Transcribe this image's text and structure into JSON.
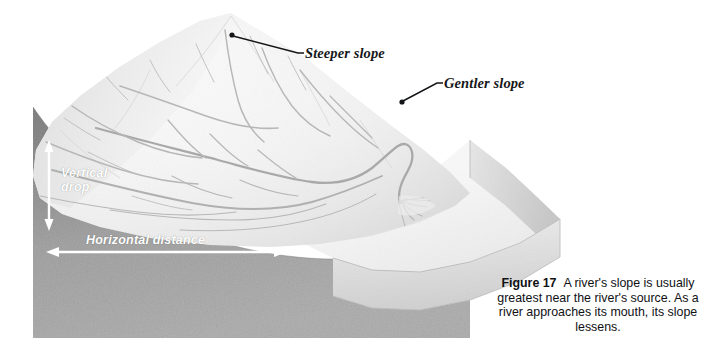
{
  "figure": {
    "number_label": "Figure 17",
    "caption_text": "A river's slope is usually greatest near the river's source. As a river approaches its mouth, its slope lessens."
  },
  "callouts": [
    {
      "id": "steeper-slope",
      "label": "Steeper slope",
      "dot": {
        "x": 232,
        "y": 35
      },
      "elbow": {
        "x": 298,
        "y": 53
      },
      "text_anchor": {
        "x": 305,
        "y": 53
      }
    },
    {
      "id": "gentler-slope",
      "label": "Gentler slope",
      "dot": {
        "x": 402,
        "y": 102
      },
      "elbow": {
        "x": 438,
        "y": 83
      },
      "text_anchor": {
        "x": 444,
        "y": 83
      }
    }
  ],
  "measurements": [
    {
      "id": "vertical-drop",
      "label": "Vertical drop",
      "orientation": "vertical",
      "arrow": {
        "x": 49,
        "y1": 142,
        "y2": 229
      },
      "color": "#ffffff"
    },
    {
      "id": "horizontal-distance",
      "label": "Horizontal distance",
      "orientation": "horizontal",
      "arrow": {
        "y": 252,
        "x1": 47,
        "x2": 286
      },
      "color": "#ffffff"
    }
  ],
  "colors": {
    "page_background": "#ffffff",
    "cross_section_light": "#adadad",
    "cross_section_dark": "#8d8d8d",
    "cross_section_bottom": "#9b9b9b",
    "terrain_top_light": "#fbfbfb",
    "terrain_top_shade": "#e2e2e2",
    "terrain_right_face": "#d5d5d5",
    "river_stroke": "#b9b9b9",
    "callout_line": "#141518",
    "caption_text": "#101114",
    "measure_label": "#ffffff"
  },
  "terrain": {
    "description": "Three-dimensional block diagram of a landscape: steep mountain headwaters at the upper left draining through a dendritic river network to a low coastal plain with a delta at the right.",
    "features": [
      {
        "name": "mountain-peak",
        "x": 231,
        "y": 14
      },
      {
        "name": "river-delta",
        "x": 404,
        "y": 200
      },
      {
        "name": "coastal-plain",
        "x": 470,
        "y": 225
      }
    ]
  }
}
